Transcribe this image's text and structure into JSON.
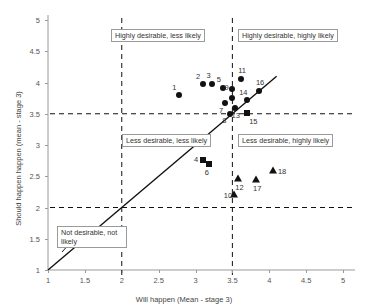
{
  "chart_data": {
    "type": "scatter",
    "title": "",
    "xlabel": "Will happen (Mean - stage 3)",
    "ylabel": "Should happen happen (mean - stage 3)",
    "xlim": [
      1,
      5
    ],
    "ylim": [
      1,
      5
    ],
    "xticks": [
      "1",
      "1.5",
      "2",
      "2.5",
      "3",
      "3.5",
      "4",
      "4.5",
      "5"
    ],
    "xtick_values": [
      1,
      1.5,
      2,
      2.5,
      3,
      3.5,
      4,
      4.5,
      5
    ],
    "yticks": [
      "1",
      "1.5",
      "2",
      "2.5",
      "3",
      "3.5",
      "4",
      "4.5",
      "5"
    ],
    "ytick_values": [
      1,
      1.5,
      2,
      2.5,
      3,
      3.5,
      4,
      4.5,
      5
    ],
    "grid": false,
    "legend": "none",
    "reference_lines": {
      "vertical_dashed": [
        2,
        3.5
      ],
      "horizontal_dashed": [
        2,
        3.5
      ],
      "diagonal_solid": {
        "from": [
          1,
          1
        ],
        "to": [
          4.1,
          4.1
        ],
        "label": "y = x"
      }
    },
    "points": [
      {
        "id": "1",
        "x": 2.78,
        "y": 3.8,
        "marker": "circle",
        "label_dx": -7,
        "label_dy": -8
      },
      {
        "id": "2",
        "x": 3.1,
        "y": 3.98,
        "marker": "circle",
        "label_dx": -7,
        "label_dy": -8
      },
      {
        "id": "3",
        "x": 3.23,
        "y": 3.98,
        "marker": "circle",
        "label_dx": -6,
        "label_dy": -9
      },
      {
        "id": "5",
        "x": 3.37,
        "y": 3.92,
        "marker": "circle",
        "label_dx": -6,
        "label_dy": -9
      },
      {
        "id": "9",
        "x": 3.5,
        "y": 3.9,
        "marker": "circle",
        "label_dx": -8,
        "label_dy": -2
      },
      {
        "id": "11",
        "x": 3.62,
        "y": 4.06,
        "marker": "circle",
        "label_dx": -3,
        "label_dy": -9
      },
      {
        "id": "16",
        "x": 3.86,
        "y": 3.86,
        "marker": "circle",
        "label_dx": -3,
        "label_dy": -9
      },
      {
        "id": "14",
        "x": 3.7,
        "y": 3.72,
        "marker": "circle",
        "label_dx": -8,
        "label_dy": -8
      },
      {
        "id": "6b",
        "x": 3.5,
        "y": 3.76,
        "marker": "circle",
        "label_dx": 0,
        "label_dy": 0,
        "hide_label": true
      },
      {
        "id": "7",
        "x": 3.4,
        "y": 3.68,
        "marker": "circle",
        "label_dx": -6,
        "label_dy": 7
      },
      {
        "id": "13",
        "x": 3.53,
        "y": 3.6,
        "marker": "circle",
        "label_dx": -3,
        "label_dy": 7
      },
      {
        "id": "8",
        "x": 3.47,
        "y": 3.5,
        "marker": "circle",
        "label_dx": -8,
        "label_dy": 6
      },
      {
        "id": "15",
        "x": 3.7,
        "y": 3.52,
        "marker": "square",
        "label_dx": 2,
        "label_dy": 8
      },
      {
        "id": "4",
        "x": 3.1,
        "y": 2.76,
        "marker": "square",
        "label_dx": -9,
        "label_dy": -1
      },
      {
        "id": "6",
        "x": 3.18,
        "y": 2.7,
        "marker": "square",
        "label_dx": -4,
        "label_dy": 8
      },
      {
        "id": "18",
        "x": 4.05,
        "y": 2.6,
        "marker": "triangle",
        "label_dx": 5,
        "label_dy": 1
      },
      {
        "id": "12",
        "x": 3.58,
        "y": 2.48,
        "marker": "triangle",
        "label_dx": -3,
        "label_dy": 9
      },
      {
        "id": "17",
        "x": 3.82,
        "y": 2.45,
        "marker": "triangle",
        "label_dx": -3,
        "label_dy": 9
      },
      {
        "id": "10",
        "x": 3.52,
        "y": 2.22,
        "marker": "triangle",
        "label_dx": -10,
        "label_dy": 1
      }
    ],
    "annotations": [
      {
        "id": "upper-left",
        "text": "Highly desirable, less likely",
        "x_px": 111,
        "y_px": 29
      },
      {
        "id": "upper-right",
        "text": "Highly desirable, highly likely",
        "x_px": 238,
        "y_px": 29
      },
      {
        "id": "lower-left",
        "text": "Less desirable, less likely",
        "x_px": 122,
        "y_px": 134
      },
      {
        "id": "lower-right",
        "text": "Less desirable, highly likely",
        "x_px": 238,
        "y_px": 134
      },
      {
        "id": "bottom-left",
        "text": "Not desirable, not likely",
        "x_px": 57,
        "y_px": 226
      }
    ]
  },
  "colors": {
    "marker": "#111111",
    "axis": "#9a9a9a",
    "text": "#333333",
    "dashed_line": "#111111",
    "solid_line": "#111111"
  }
}
